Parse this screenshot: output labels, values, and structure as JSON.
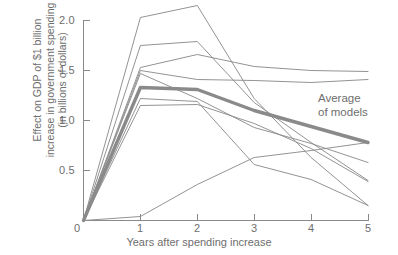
{
  "chart_data": {
    "type": "line",
    "title": "",
    "subtitle": "",
    "xlabel": "Years after spending increase",
    "ylabel": "Effect on GDP of $1 billion increase in government spending (in billions of dollars)",
    "ylabel_lines": [
      "Effect on GDP of $1 billion",
      "increase in government spending",
      "(in billions of dollars)"
    ],
    "x": [
      0,
      1,
      2,
      3,
      4,
      5
    ],
    "xlim": [
      0,
      5
    ],
    "ylim": [
      0,
      2.15
    ],
    "xticks": [
      "0",
      "1",
      "2",
      "3",
      "4",
      "5"
    ],
    "yticks": [
      "0",
      "0.5",
      "1.0",
      "1.5",
      "2.0"
    ],
    "ytick_values": [
      0,
      0.5,
      1.0,
      1.5,
      2.0
    ],
    "grid": false,
    "legend": "none",
    "annotations": [
      {
        "name": "average-of-models",
        "lines": [
          "Average",
          "of models"
        ],
        "text": "Average of models",
        "x": 4.1,
        "y": 1.23
      }
    ],
    "series": [
      {
        "name": "model-1",
        "role": "model",
        "emphasis": "normal",
        "values": [
          0.0,
          2.03,
          2.15,
          1.22,
          0.63,
          0.15
        ]
      },
      {
        "name": "model-2",
        "role": "model",
        "emphasis": "normal",
        "values": [
          0.0,
          1.75,
          1.79,
          1.18,
          0.78,
          0.4
        ]
      },
      {
        "name": "model-3",
        "role": "model",
        "emphasis": "normal",
        "values": [
          0.0,
          1.53,
          1.66,
          1.54,
          1.5,
          1.49
        ]
      },
      {
        "name": "model-4",
        "role": "model",
        "emphasis": "normal",
        "values": [
          0.0,
          1.5,
          1.41,
          1.4,
          1.38,
          1.41
        ]
      },
      {
        "name": "model-5",
        "role": "model",
        "emphasis": "normal",
        "values": [
          0.0,
          1.47,
          1.22,
          0.93,
          0.77,
          0.58
        ]
      },
      {
        "name": "model-6",
        "role": "model",
        "emphasis": "normal",
        "values": [
          0.0,
          1.22,
          1.19,
          0.56,
          0.41,
          0.15
        ]
      },
      {
        "name": "model-7",
        "role": "model",
        "emphasis": "normal",
        "values": [
          0.0,
          1.15,
          1.16,
          0.97,
          0.72,
          0.39
        ]
      },
      {
        "name": "model-8",
        "role": "model",
        "emphasis": "normal",
        "values": [
          0.0,
          0.04,
          0.36,
          0.63,
          0.7,
          0.78
        ]
      },
      {
        "name": "average-of-models",
        "role": "average",
        "emphasis": "thick",
        "values": [
          0.0,
          1.33,
          1.31,
          1.1,
          0.94,
          0.78
        ]
      }
    ]
  },
  "colors": {
    "background": "#ffffff",
    "axis": "#8a8a8a",
    "model_line": "#8d8d8d",
    "average_line": "#8a8a8a",
    "text": "#6e6e6e"
  }
}
